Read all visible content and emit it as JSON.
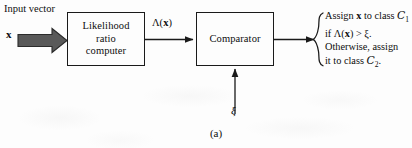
{
  "figure": {
    "caption": "(a)",
    "title_implied": "Likelihood ratio test block diagram"
  },
  "input": {
    "label": "Input vector",
    "symbol": "x",
    "arrow_icon": "thick-block-arrow-right-icon",
    "arrow_color": "#595959"
  },
  "blocks": [
    {
      "id": "likelihood-ratio-computer",
      "lines": [
        "Likelihood",
        "ratio",
        "computer"
      ]
    },
    {
      "id": "comparator",
      "lines": [
        "Comparator"
      ]
    }
  ],
  "signals": {
    "lambda_label_prefix": "Λ(",
    "lambda_label_var": "x",
    "lambda_label_suffix": ")",
    "threshold_symbol": "ξ"
  },
  "decision": {
    "brace_icon": "left-curly-brace-icon",
    "line1_pre": "Assign ",
    "line1_var": "x",
    "line1_post": " to class ",
    "line1_class": "C",
    "line1_sub": "1",
    "line2_pre": "if Λ(",
    "line2_var": "x",
    "line2_post": ") > ξ.",
    "line3": "Otherwise, assign",
    "line4_pre": "it to class ",
    "line4_class": "C",
    "line4_sub": "2",
    "line4_post": "."
  },
  "colors": {
    "ink": "#0d0d0d",
    "line": "#1a1a1a",
    "paper": "#fdfdfd",
    "block_arrow_fill": "#595959",
    "block_arrow_stroke": "#2b2b2b"
  }
}
